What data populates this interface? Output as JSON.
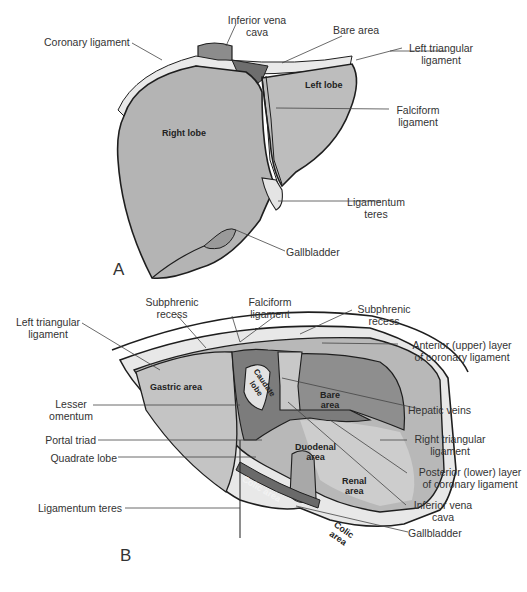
{
  "figure_a": {
    "panel_letter": "A",
    "inner_labels": {
      "right_lobe": "Right lobe",
      "left_lobe": "Left lobe"
    },
    "callouts": {
      "coronary_ligament": "Coronary ligament",
      "ivc_line1": "Inferior vena",
      "ivc_line2": "cava",
      "bare_area": "Bare area",
      "left_triangular_line1": "Left triangular",
      "left_triangular_line2": "ligament",
      "falciform_line1": "Falciform",
      "falciform_line2": "ligament",
      "lig_teres_line1": "Ligamentum",
      "lig_teres_line2": "teres",
      "gallbladder": "Gallbladder"
    }
  },
  "figure_b": {
    "panel_letter": "B",
    "inner_labels": {
      "gastric_area": "Gastric area",
      "caudate_lobe_line1": "Caudate",
      "caudate_lobe_line2": "lobe",
      "bare_area_line1": "Bare",
      "bare_area_line2": "area",
      "duodenal_area_line1": "Duodenal",
      "duodenal_area_line2": "area",
      "renal_area_line1": "Renal",
      "renal_area_line2": "area",
      "colic_area_left": "Colic area",
      "colic_area_right_line1": "Colic",
      "colic_area_right_line2": "area"
    },
    "callouts": {
      "subphrenic_left_line1": "Subphrenic",
      "subphrenic_left_line2": "recess",
      "falciform_line1": "Falciform",
      "falciform_line2": "ligament",
      "subphrenic_right_line1": "Subphrenic",
      "subphrenic_right_line2": "recess",
      "left_triangular_line1": "Left triangular",
      "left_triangular_line2": "ligament",
      "anterior_layer_line1": "Anterior (upper) layer",
      "anterior_layer_line2": "of coronary ligament",
      "lesser_omentum_line1": "Lesser",
      "lesser_omentum_line2": "omentum",
      "hepatic_veins": "Hepatic veins",
      "portal_triad": "Portal triad",
      "right_triangular_line1": "Right triangular",
      "right_triangular_line2": "ligament",
      "quadrate_lobe": "Quadrate lobe",
      "posterior_layer_line1": "Posterior (lower) layer",
      "posterior_layer_line2": "of coronary ligament",
      "ivc_line1": "Inferior vena",
      "ivc_line2": "cava",
      "lig_teres": "Ligamentum teres",
      "gallbladder": "Gallbladder"
    }
  },
  "colors": {
    "liver_fill": "#b4b4b4",
    "liver_dark": "#8a8a8a",
    "bare_dark": "#6e6e6e",
    "ligament_light": "#e6e6e6",
    "outline": "#1e1e1e",
    "leader": "#444444"
  }
}
